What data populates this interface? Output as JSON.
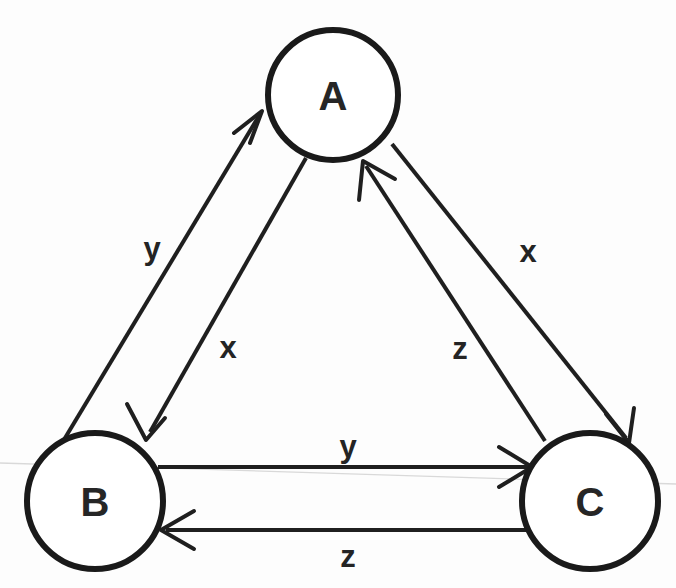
{
  "diagram": {
    "type": "state-transition-diagram",
    "background_color": "#fdfdfd",
    "stroke_color": "#1f1f1f",
    "node_fill": "#ffffff",
    "nodes": [
      {
        "id": "A",
        "label": "A",
        "cx": 333,
        "cy": 95,
        "r": 65
      },
      {
        "id": "B",
        "label": "B",
        "cx": 95,
        "cy": 501,
        "r": 68
      },
      {
        "id": "C",
        "label": "C",
        "cx": 590,
        "cy": 501,
        "r": 68
      }
    ],
    "edges": [
      {
        "id": "b-to-a",
        "from": "B",
        "to": "A",
        "label": "y",
        "label_x": 152,
        "label_y": 248
      },
      {
        "id": "a-to-b",
        "from": "A",
        "to": "B",
        "label": "x",
        "label_x": 228,
        "label_y": 347
      },
      {
        "id": "a-to-c",
        "from": "A",
        "to": "C",
        "label": "x",
        "label_x": 528,
        "label_y": 251
      },
      {
        "id": "c-to-a",
        "from": "C",
        "to": "A",
        "label": "z",
        "label_x": 460,
        "label_y": 348
      },
      {
        "id": "b-to-c",
        "from": "B",
        "to": "C",
        "label": "y",
        "label_x": 348,
        "label_y": 446
      },
      {
        "id": "c-to-b",
        "from": "C",
        "to": "B",
        "label": "z",
        "label_x": 348,
        "label_y": 556
      }
    ]
  }
}
